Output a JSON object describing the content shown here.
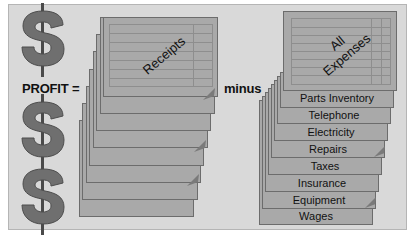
{
  "diagram": {
    "equation": {
      "profit_label": "PROFIT =",
      "operator_label": "minus"
    },
    "receipts": {
      "title": "Receipts",
      "sheet_count": 8
    },
    "expenses": {
      "title_line1": "All",
      "title_line2": "Expenses",
      "items": [
        {
          "label": "Parts Inventory"
        },
        {
          "label": "Telephone"
        },
        {
          "label": "Electricity"
        },
        {
          "label": "Repairs"
        },
        {
          "label": "Taxes"
        },
        {
          "label": "Insurance"
        },
        {
          "label": "Equipment"
        },
        {
          "label": "Wages"
        }
      ]
    },
    "icons": [
      "dollar-sign-icon",
      "dollar-sign-icon",
      "dollar-sign-icon"
    ],
    "colors": {
      "background": "#d9d9d9",
      "sheet": "#a9a9a9",
      "sheet_border": "#6c6c6c",
      "dollar": "#6f6f6f"
    }
  }
}
